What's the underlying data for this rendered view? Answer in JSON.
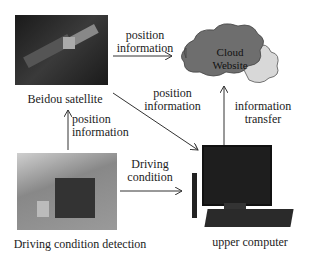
{
  "nodes": {
    "satellite": {
      "label": "Beidou satellite",
      "icon": "satellite-photo"
    },
    "cloud": {
      "line1": "Cloud",
      "line2": "Website",
      "icon": "cloud-icon"
    },
    "detection": {
      "label": "Driving condition detection",
      "icon": "detection-device-photo"
    },
    "computer": {
      "label": "upper computer",
      "icon": "computer-photo"
    }
  },
  "edges": {
    "sat_to_cloud": {
      "line1": "position",
      "line2": "information"
    },
    "sat_to_computer": {
      "line1": "position",
      "line2": "information"
    },
    "detection_to_sat": {
      "line1": "position",
      "line2": "information"
    },
    "detection_to_computer": {
      "line1": "Driving",
      "line2": "condition"
    },
    "computer_to_cloud": {
      "line1": "information",
      "line2": "transfer"
    }
  },
  "colors": {
    "cloud_fill": "#6e6e6e",
    "cloud_back": "#d8d8d8",
    "arrow": "#333333"
  }
}
